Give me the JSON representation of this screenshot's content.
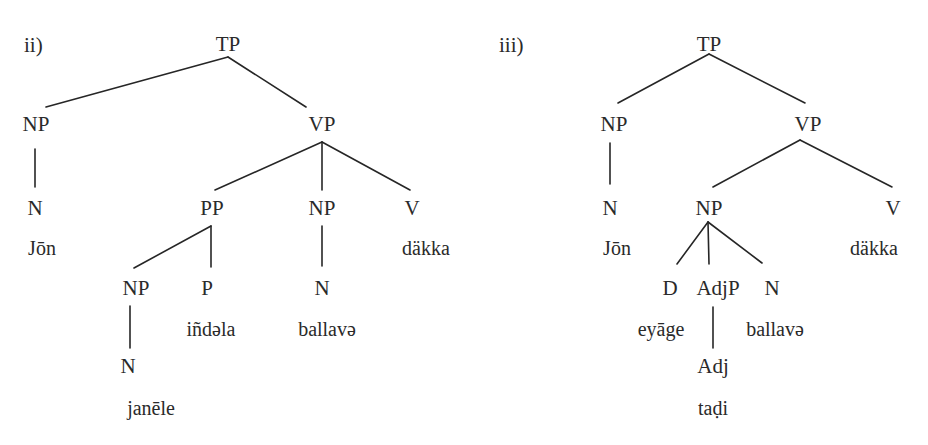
{
  "trees": [
    {
      "id": "ii",
      "example_label": "ii)",
      "nodes": {
        "tp": "TP",
        "np_subj": "NP",
        "n_subj": "N",
        "w_subj": "Jōn",
        "vp": "VP",
        "pp": "PP",
        "np_obj": "NP",
        "v": "V",
        "w_v": "däkka",
        "np_in_pp": "NP",
        "p": "P",
        "w_p": "iñdəla",
        "n_obj": "N",
        "w_obj": "ballavə",
        "n_in_pp": "N",
        "w_in_pp": "janēle"
      },
      "structure": "[TP [NP [N Jōn]] [VP [PP [NP [N janēle]] [P iñdəla]] [NP [N ballavə]] [V däkka]]]"
    },
    {
      "id": "iii",
      "example_label": "iii)",
      "nodes": {
        "tp": "TP",
        "np_subj": "NP",
        "n_subj": "N",
        "w_subj": "Jōn",
        "vp": "VP",
        "np_obj": "NP",
        "v": "V",
        "w_v": "däkka",
        "d": "D",
        "w_d": "eyāge",
        "adjp": "AdjP",
        "adj": "Adj",
        "w_adj": "taḍi",
        "n_obj": "N",
        "w_obj": "ballavə"
      },
      "structure": "[TP [NP [N Jōn]] [VP [NP [D eyāge] [AdjP [Adj taḍi]] [N ballavə]] [V däkka]]]"
    }
  ]
}
